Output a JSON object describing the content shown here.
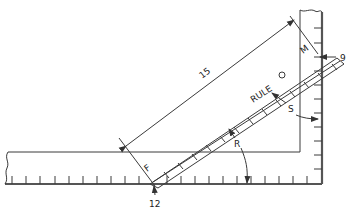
{
  "diagram": {
    "title": "",
    "labels": {
      "rule": "RULE",
      "dimension": "15",
      "mark_m": "M",
      "mark_f": "F",
      "angle_r": "R",
      "angle_s": "S",
      "reading_top": "9",
      "reading_bottom": "12"
    },
    "colors": {
      "line": "#3a3a3a",
      "background": "#ffffff"
    }
  }
}
